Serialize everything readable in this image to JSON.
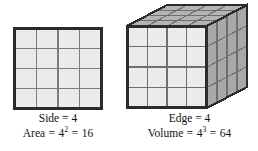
{
  "figure": {
    "background_color": "#ffffff",
    "ink_color": "#111111"
  },
  "square_figure": {
    "name": "square-grid-figure",
    "rows": 4,
    "columns": 4,
    "cells_total": 16,
    "fill_color": "#ebebeb",
    "border_color": "#2b2b2b",
    "grid_line_color": "#7d7d7d",
    "caption": {
      "line1_label": "Side",
      "line1_equals": "=",
      "line1_value": "4",
      "line1_text": "Side = 4",
      "line2_label": "Area",
      "line2_base": "4",
      "line2_exponent": "2",
      "line2_result": "16",
      "line2_text": "Area = 4² = 16"
    }
  },
  "cube_figure": {
    "name": "cube-grid-figure",
    "rows": 4,
    "columns": 4,
    "layers": 4,
    "cells_total": 64,
    "front_face_color": "#ebebeb",
    "top_face_color": "#b4b4b4",
    "right_face_color": "#a8a8a8",
    "border_color": "#2b2b2b",
    "grid_line_color": "#6f6f6f",
    "caption": {
      "line1_label": "Edge",
      "line1_equals": "=",
      "line1_value": "4",
      "line1_text": "Edge = 4",
      "line2_label": "Volume",
      "line2_base": "4",
      "line2_exponent": "3",
      "line2_result": "64",
      "line2_text": "Volume = 4³ = 64"
    }
  },
  "symbols": {
    "equals": "=",
    "space": " "
  }
}
